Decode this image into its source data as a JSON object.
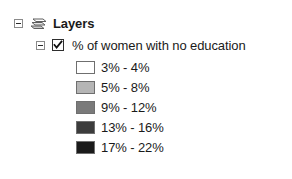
{
  "panel": {
    "title": "Layers"
  },
  "tree": {
    "root": {
      "label": "Layers",
      "expander_state": "expanded",
      "icon": "layers-stack-icon"
    },
    "layer": {
      "label": "% of women with no education",
      "expander_state": "expanded",
      "checked": true
    }
  },
  "legend": {
    "classes": [
      {
        "label": "3% - 4%",
        "color": "#ffffff"
      },
      {
        "label": "5% - 8%",
        "color": "#b5b5b5"
      },
      {
        "label": "9% - 12%",
        "color": "#7a7a7a"
      },
      {
        "label": "13% - 16%",
        "color": "#3c3c3c"
      },
      {
        "label": "17% - 22%",
        "color": "#1a1a1a"
      }
    ]
  }
}
